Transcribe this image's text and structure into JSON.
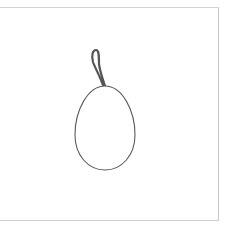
{
  "canvas": {
    "width": 225,
    "height": 228,
    "background": "#ffffff"
  },
  "frame": {
    "border_color": "#cccccc"
  },
  "illustration": {
    "subject": "egg-ornament",
    "stroke_color": "#5a5a5a",
    "loop_color": "#555555",
    "fill": "#ffffff"
  }
}
